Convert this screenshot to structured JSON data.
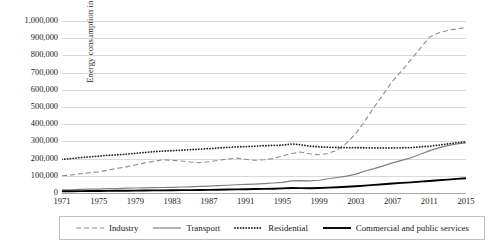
{
  "chart_data": {
    "type": "line",
    "title": "",
    "xlabel": "",
    "ylabel": "Energy consumption in ktoe",
    "xlim": [
      1971,
      2015
    ],
    "ylim": [
      0,
      1000000
    ],
    "grid": true,
    "legend_position": "bottom",
    "x": [
      1971,
      1972,
      1973,
      1974,
      1975,
      1976,
      1977,
      1978,
      1979,
      1980,
      1981,
      1982,
      1983,
      1984,
      1985,
      1986,
      1987,
      1988,
      1989,
      1990,
      1991,
      1992,
      1993,
      1994,
      1995,
      1996,
      1997,
      1998,
      1999,
      2000,
      2001,
      2002,
      2003,
      2004,
      2005,
      2006,
      2007,
      2008,
      2009,
      2010,
      2011,
      2012,
      2013,
      2014,
      2015
    ],
    "y_ticks": [
      0,
      100000,
      200000,
      300000,
      400000,
      500000,
      600000,
      700000,
      800000,
      900000,
      1000000
    ],
    "y_tick_labels": [
      "0",
      "100,000",
      "200,000",
      "300,000",
      "400,000",
      "500,000",
      "600,000",
      "700,000",
      "800,000",
      "900,000",
      "1,000,000"
    ],
    "x_ticks": [
      1971,
      1975,
      1979,
      1983,
      1987,
      1991,
      1995,
      1999,
      2003,
      2007,
      2011,
      2015
    ],
    "x_tick_labels": [
      "1971",
      "1975",
      "1979",
      "1983",
      "1987",
      "1991",
      "1995",
      "1999",
      "2003",
      "2007",
      "2011",
      "2015"
    ],
    "series": [
      {
        "name": "Industry",
        "style": "dashed",
        "color": "#8c8c8c",
        "width": 1.1,
        "values": [
          100000,
          105000,
          112000,
          118000,
          122000,
          133000,
          143000,
          152000,
          163000,
          175000,
          184000,
          193000,
          190000,
          186000,
          180000,
          176000,
          182000,
          190000,
          197000,
          203000,
          196000,
          190000,
          193000,
          200000,
          215000,
          230000,
          238000,
          228000,
          222000,
          230000,
          250000,
          290000,
          345000,
          420000,
          500000,
          575000,
          650000,
          710000,
          775000,
          840000,
          905000,
          930000,
          945000,
          955000,
          962000
        ]
      },
      {
        "name": "Transport",
        "style": "solid",
        "color": "#7f7f7f",
        "width": 1.2,
        "values": [
          18000,
          19000,
          21000,
          22000,
          23000,
          25000,
          26000,
          28000,
          29000,
          30000,
          31000,
          32000,
          33000,
          35000,
          36000,
          38000,
          40000,
          43000,
          45000,
          48000,
          50000,
          52000,
          55000,
          58000,
          62000,
          70000,
          72000,
          71000,
          74000,
          83000,
          90000,
          98000,
          110000,
          128000,
          142000,
          158000,
          175000,
          190000,
          205000,
          225000,
          245000,
          262000,
          275000,
          285000,
          292000
        ]
      },
      {
        "name": "Residential",
        "style": "dotted",
        "color": "#262626",
        "width": 1.8,
        "values": [
          196000,
          200000,
          206000,
          210000,
          214000,
          219000,
          222000,
          226000,
          231000,
          236000,
          240000,
          244000,
          246000,
          249000,
          252000,
          255000,
          258000,
          262000,
          265000,
          268000,
          270000,
          272000,
          275000,
          277000,
          278000,
          285000,
          280000,
          272000,
          268000,
          266000,
          265000,
          264000,
          263000,
          263000,
          262000,
          262000,
          262000,
          263000,
          264000,
          268000,
          272000,
          278000,
          285000,
          292000,
          298000
        ]
      },
      {
        "name": "Commercial and public services",
        "style": "solid",
        "color": "#000000",
        "width": 1.9,
        "values": [
          10000,
          10500,
          11000,
          11500,
          12000,
          12500,
          13000,
          13500,
          14000,
          14500,
          15000,
          15500,
          16000,
          16500,
          17000,
          17500,
          18000,
          19000,
          20000,
          21000,
          22000,
          23000,
          24000,
          25000,
          27000,
          29000,
          28500,
          28000,
          29000,
          31000,
          33000,
          36000,
          39000,
          43000,
          47000,
          51000,
          55000,
          59000,
          62000,
          66000,
          70000,
          74000,
          78000,
          82000,
          86000
        ]
      }
    ]
  },
  "legend": {
    "items": [
      {
        "label": "Industry"
      },
      {
        "label": "Transport"
      },
      {
        "label": "Residential"
      },
      {
        "label": "Commercial and public services"
      }
    ]
  }
}
